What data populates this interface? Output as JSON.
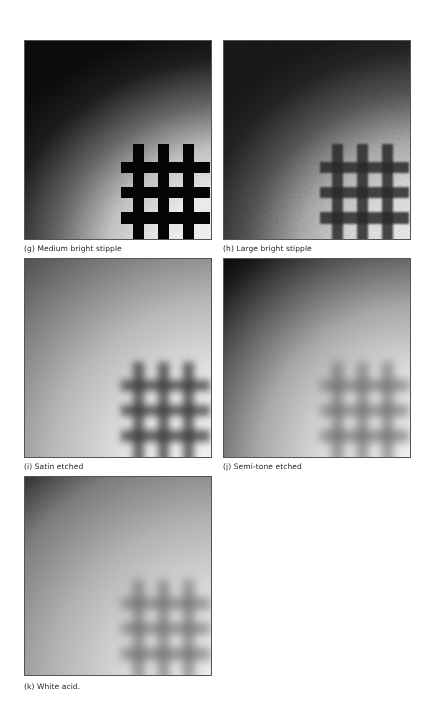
{
  "figures": [
    {
      "id": "g",
      "caption": "(g) Medium bright stipple",
      "grid_visibility": "sharp"
    },
    {
      "id": "h",
      "caption": "(h) Large bright stipple",
      "grid_visibility": "grainy"
    },
    {
      "id": "i",
      "caption": "(i) Satin etched",
      "grid_visibility": "soft"
    },
    {
      "id": "j",
      "caption": "(j) Semi-tone etched",
      "grid_visibility": "diffuse"
    },
    {
      "id": "k",
      "caption": "(k) White acid.",
      "grid_visibility": "diffuse"
    }
  ]
}
